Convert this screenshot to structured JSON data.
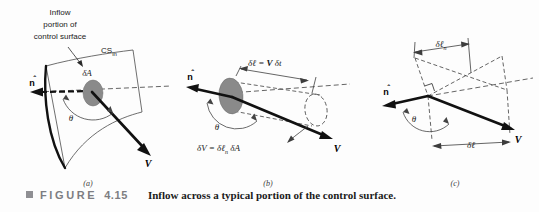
{
  "figure": {
    "bullet_icon": "square-bullet",
    "figure_word": "FIGURE",
    "figure_number": "4.15",
    "caption": "Inflow across a typical portion of the control surface.",
    "caption_word_color": "#7d7d82",
    "caption_text_color": "#1b1b1b"
  },
  "colors": {
    "background": "#fdfdfd",
    "ink": "#1a1a1a",
    "surface_gray": "#8a8a8a",
    "thin_line": "#4a4a4a",
    "dashed_line": "#3d3d3d"
  },
  "panels": [
    {
      "id": "a",
      "label": "(a)",
      "annotations": {
        "inflow_note_line1": "Inflow",
        "inflow_note_line2": "portion of",
        "inflow_note_line3": "control surface",
        "cs_label": "CS",
        "cs_subscript": "in",
        "area_label": "δA",
        "normal_label": "n",
        "angle_label": "θ",
        "velocity_label": "V"
      }
    },
    {
      "id": "b",
      "label": "(b)",
      "annotations": {
        "length_eq_lhs": "δℓ = ",
        "length_eq_v": "V",
        "length_eq_rhs": " δt",
        "volume_eq_lhs": "δV = δℓ",
        "volume_eq_sub": "n",
        "volume_eq_rhs": " δA",
        "normal_label": "n",
        "angle_label": "θ",
        "velocity_label": "V"
      }
    },
    {
      "id": "c",
      "label": "(c)",
      "annotations": {
        "normal_length_label": "δℓ",
        "normal_length_sub": "n",
        "length_label": "δℓ",
        "normal_label": "n",
        "angle_label": "θ",
        "velocity_label": "V",
        "right_angle_marker": "right-angle-symbol"
      }
    }
  ]
}
